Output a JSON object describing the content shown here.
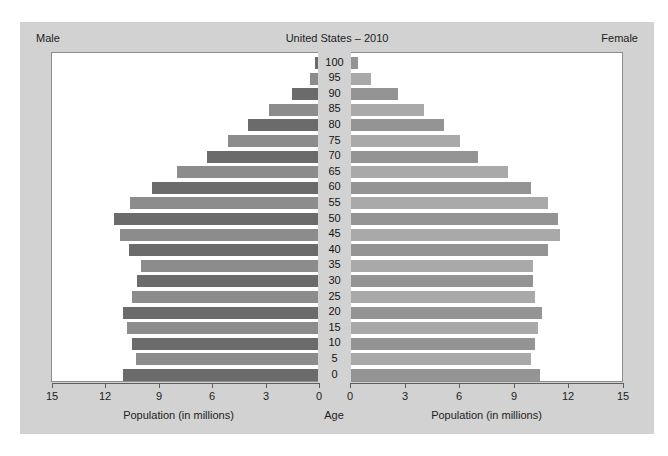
{
  "figure": {
    "title": "United States – 2010",
    "left_corner_label": "Male",
    "right_corner_label": "Female",
    "center_axis_label": "Age",
    "left_axis_title": "Population (in millions)",
    "right_axis_title": "Population (in millions)",
    "background_color": "#d2d2d2",
    "panel_color": "#ffffff"
  },
  "colors": {
    "male_dark": "#6b6b6b",
    "male_light": "#8c8c8c",
    "female_dark": "#949494",
    "female_light": "#a9a9a9",
    "axis": "#5e5e5e",
    "text": "#1c1c1c"
  },
  "chart_data": {
    "type": "bar",
    "subtype": "population-pyramid",
    "title": "United States – 2010",
    "xlabel": "Population (in millions)",
    "ylabel": "Age",
    "xlim": [
      0,
      15
    ],
    "grid": false,
    "left_tick_labels": [
      "15",
      "12",
      "9",
      "6",
      "3",
      "0"
    ],
    "right_tick_labels": [
      "0",
      "3",
      "6",
      "9",
      "12",
      "15"
    ],
    "tick_values": [
      0,
      3,
      6,
      9,
      12,
      15
    ],
    "categories": [
      "0",
      "5",
      "10",
      "15",
      "20",
      "25",
      "30",
      "35",
      "40",
      "45",
      "50",
      "55",
      "60",
      "65",
      "70",
      "75",
      "80",
      "85",
      "90",
      "95",
      "100"
    ],
    "series": [
      {
        "name": "Male",
        "side": "left",
        "values": [
          11.0,
          10.3,
          10.5,
          10.8,
          11.0,
          10.5,
          10.2,
          10.0,
          10.7,
          11.2,
          11.5,
          10.6,
          9.4,
          8.0,
          6.3,
          5.1,
          4.0,
          2.8,
          1.5,
          0.5,
          0.2
        ]
      },
      {
        "name": "Female",
        "side": "right",
        "values": [
          10.4,
          9.9,
          10.1,
          10.3,
          10.5,
          10.1,
          10.0,
          10.0,
          10.8,
          11.5,
          11.4,
          10.8,
          9.9,
          8.6,
          7.0,
          6.0,
          5.1,
          4.0,
          2.6,
          1.1,
          0.4
        ]
      }
    ]
  }
}
